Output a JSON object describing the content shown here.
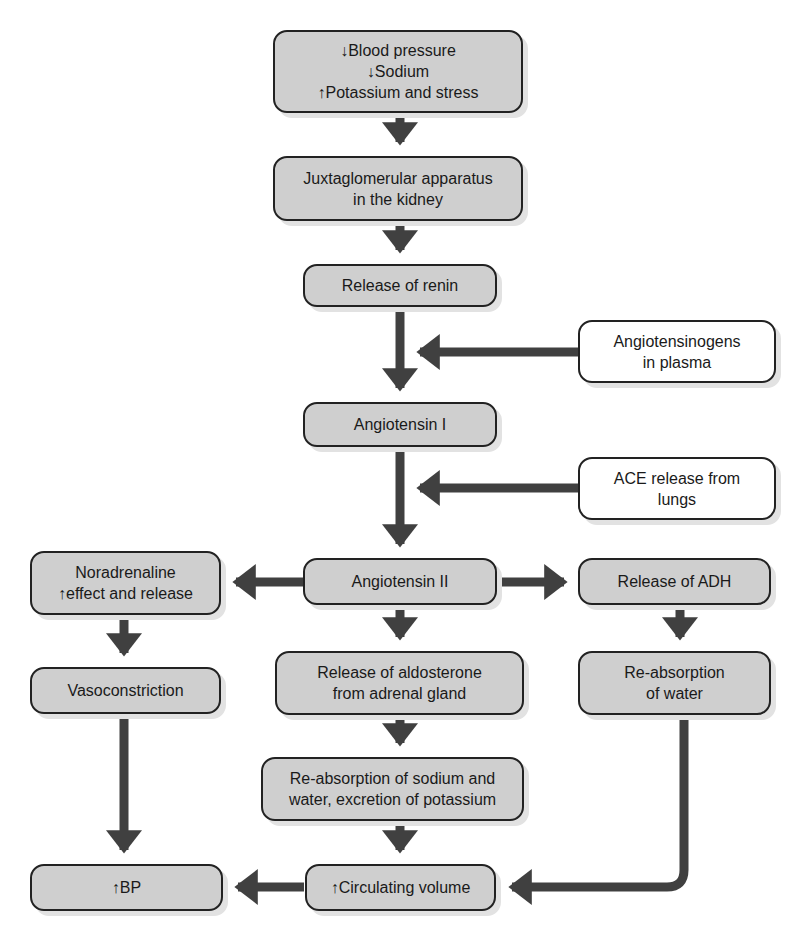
{
  "diagram": {
    "nodes": {
      "trigger": {
        "label": "↓Blood pressure\n↓Sodium\n↑Potassium and stress"
      },
      "juxtaglomerular": {
        "label": "Juxtaglomerular apparatus\nin the kidney"
      },
      "renin": {
        "label": "Release of renin"
      },
      "angiotensinogens": {
        "label": "Angiotensinogens\nin plasma"
      },
      "angiotensin1": {
        "label": "Angiotensin I"
      },
      "ace": {
        "label": "ACE release from\nlungs"
      },
      "angiotensin2": {
        "label": "Angiotensin II"
      },
      "noradrenaline": {
        "label": "Noradrenaline\n↑effect and release"
      },
      "adh": {
        "label": "Release of ADH"
      },
      "vasoconstriction": {
        "label": "Vasoconstriction"
      },
      "aldosterone": {
        "label": "Release of aldosterone\nfrom adrenal gland"
      },
      "water_reabsorption": {
        "label": "Re-absorption\nof water"
      },
      "sodium_reabsorption": {
        "label": "Re-absorption of sodium and\nwater, excretion of potassium"
      },
      "bp": {
        "label": "↑BP"
      },
      "circulating_volume": {
        "label": "↑Circulating volume"
      }
    },
    "edges": [
      [
        "trigger",
        "juxtaglomerular"
      ],
      [
        "juxtaglomerular",
        "renin"
      ],
      [
        "renin",
        "angiotensin1"
      ],
      [
        "angiotensinogens",
        "renin-angiotensin1-link"
      ],
      [
        "angiotensin1",
        "angiotensin2"
      ],
      [
        "ace",
        "angiotensin1-angiotensin2-link"
      ],
      [
        "angiotensin2",
        "noradrenaline"
      ],
      [
        "angiotensin2",
        "adh"
      ],
      [
        "angiotensin2",
        "aldosterone"
      ],
      [
        "noradrenaline",
        "vasoconstriction"
      ],
      [
        "vasoconstriction",
        "bp"
      ],
      [
        "adh",
        "water_reabsorption"
      ],
      [
        "water_reabsorption",
        "circulating_volume"
      ],
      [
        "aldosterone",
        "sodium_reabsorption"
      ],
      [
        "sodium_reabsorption",
        "circulating_volume"
      ],
      [
        "circulating_volume",
        "bp"
      ]
    ],
    "colors": {
      "box_fill": "#cfcfcf",
      "box_white": "#ffffff",
      "border": "#222222",
      "arrow": "#404040"
    }
  }
}
